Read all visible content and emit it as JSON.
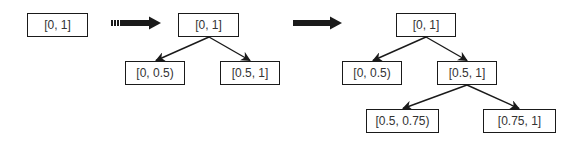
{
  "diagram": {
    "title": "",
    "colors": {
      "border": "#1a1a1a",
      "text": "#333333",
      "arrow": "#1a1a1a",
      "background": "#ffffff"
    },
    "stages": [
      {
        "nodes": [
          {
            "id": "s1_root",
            "label": "[0, 1]"
          }
        ]
      },
      {
        "nodes": [
          {
            "id": "s2_root",
            "label": "[0, 1]"
          },
          {
            "id": "s2_left",
            "label": "[0, 0.5)"
          },
          {
            "id": "s2_right",
            "label": "[0.5, 1]"
          }
        ],
        "edges": [
          {
            "from": "s2_root",
            "to": "s2_left"
          },
          {
            "from": "s2_root",
            "to": "s2_right"
          }
        ]
      },
      {
        "nodes": [
          {
            "id": "s3_root",
            "label": "[0, 1]"
          },
          {
            "id": "s3_left",
            "label": "[0, 0.5)"
          },
          {
            "id": "s3_right",
            "label": "[0.5, 1]"
          },
          {
            "id": "s3_right_left",
            "label": "[0.5, 0.75)"
          },
          {
            "id": "s3_right_right",
            "label": "[0.75, 1]"
          }
        ],
        "edges": [
          {
            "from": "s3_root",
            "to": "s3_left"
          },
          {
            "from": "s3_root",
            "to": "s3_right"
          },
          {
            "from": "s3_right",
            "to": "s3_right_left"
          },
          {
            "from": "s3_right",
            "to": "s3_right_right"
          }
        ]
      }
    ],
    "transitions": [
      {
        "from_stage": 1,
        "to_stage": 2,
        "icon": "thick-right-arrow-icon"
      },
      {
        "from_stage": 2,
        "to_stage": 3,
        "icon": "thick-right-arrow-icon"
      }
    ]
  }
}
